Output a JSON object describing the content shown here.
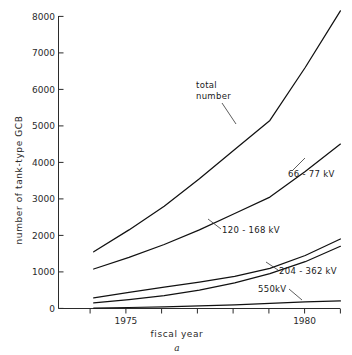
{
  "figure": {
    "subfigure_label": "a",
    "background": "#ffffff",
    "line_color": "#111111"
  },
  "chart_data": {
    "type": "line",
    "title": "",
    "xlabel": "fiscal year",
    "ylabel": "number of tank-type GCB",
    "xlim": [
      1973.3,
      1981.2
    ],
    "ylim": [
      0,
      8400
    ],
    "yticks": [
      0,
      1000,
      2000,
      3000,
      4000,
      5000,
      6000,
      7000,
      8000
    ],
    "ytick_labels": [
      "0",
      "1000",
      "2000",
      "3000",
      "4000",
      "5000",
      "6000",
      "7000",
      "8000"
    ],
    "xticks": [
      1974,
      1975,
      1976,
      1977,
      1978,
      1979,
      1980,
      1981
    ],
    "xtick_labels": [
      "",
      "1975",
      "",
      "",
      "",
      "",
      "1980",
      ""
    ],
    "grid": false,
    "legend": "inline-annotations",
    "x": [
      1974,
      1975,
      1976,
      1977,
      1978,
      1979,
      1980,
      1981
    ],
    "series": [
      {
        "name": "total number",
        "label": "total number",
        "values": [
          1550,
          2150,
          2800,
          3550,
          4350,
          5150,
          6600,
          8150
        ]
      },
      {
        "name": "66-77 kV",
        "label": "66 - 77 kV",
        "values": [
          1080,
          1400,
          1750,
          2150,
          2600,
          3050,
          3750,
          4500
        ]
      },
      {
        "name": "120-168 kV",
        "label": "120 - 168 kV",
        "values": [
          290,
          440,
          580,
          720,
          880,
          1100,
          1450,
          1900
        ]
      },
      {
        "name": "204-362 kV",
        "label": "204 - 362 kV",
        "values": [
          150,
          240,
          350,
          500,
          700,
          950,
          1280,
          1700
        ]
      },
      {
        "name": "550 kV",
        "label": "550kV",
        "values": [
          10,
          25,
          45,
          70,
          100,
          140,
          180,
          205
        ]
      }
    ],
    "annotations": [
      {
        "text": "total number",
        "series": "total number"
      },
      {
        "text": "66 - 77 kV",
        "series": "66-77 kV"
      },
      {
        "text": "120 - 168 kV",
        "series": "120-168 kV"
      },
      {
        "text": "204 - 362 kV",
        "series": "204-362 kV"
      },
      {
        "text": "550kV",
        "series": "550 kV"
      }
    ]
  }
}
